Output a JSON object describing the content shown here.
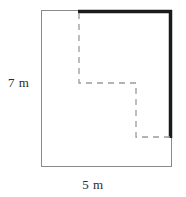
{
  "figure": {
    "canvas": {
      "width": 186,
      "height": 197,
      "background": "#ffffff"
    },
    "labels": {
      "height": "7 m",
      "width": "5 m"
    },
    "colors": {
      "outline": "#8a8a8a",
      "bold_edge": "#1a1a1a",
      "dashed": "#9a9a9a",
      "text": "#2b2b2b",
      "background": "#ffffff"
    },
    "rectangle": {
      "name": "outer-rectangle",
      "x": 41,
      "y": 10,
      "width": 131,
      "height": 157,
      "stroke_width": 1
    },
    "bold_edges": [
      {
        "name": "top-bold-edge",
        "x1": 78,
        "y1": 11.5,
        "x2": 172,
        "y2": 11.5,
        "stroke_width": 3.5
      },
      {
        "name": "right-bold-edge",
        "x1": 170.5,
        "y1": 10,
        "x2": 170.5,
        "y2": 138,
        "stroke_width": 3.5
      }
    ],
    "dashed_path": {
      "name": "stepped-dashed-cut",
      "dash_array": "6 5",
      "stroke_width": 1.3,
      "points": [
        {
          "x": 79,
          "y": 13
        },
        {
          "x": 79,
          "y": 83
        },
        {
          "x": 136,
          "y": 83
        },
        {
          "x": 136,
          "y": 137
        },
        {
          "x": 170,
          "y": 137
        }
      ]
    }
  }
}
